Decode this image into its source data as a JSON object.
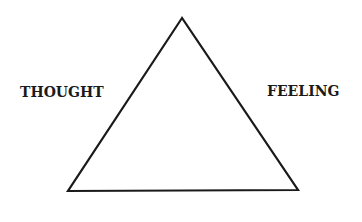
{
  "diagram": {
    "type": "triangle",
    "stroke_color": "#1a1a1a",
    "background": "#ffffff",
    "vertices": {
      "top": [
        182,
        18
      ],
      "bottom_left": [
        68,
        191
      ],
      "bottom_right": [
        298,
        190
      ]
    },
    "labels": {
      "left": "THOUGHT",
      "right": "FEELING"
    }
  }
}
